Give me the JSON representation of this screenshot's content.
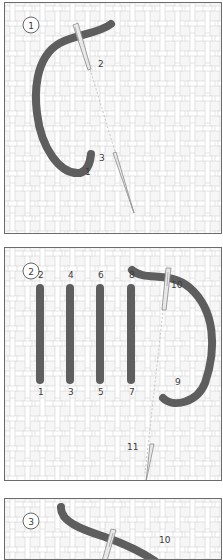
{
  "diagram": {
    "panels": [
      {
        "step": "1",
        "labels": [
          {
            "text": "2",
            "x": 93,
            "y": 64
          },
          {
            "text": "3",
            "x": 94,
            "y": 158
          },
          {
            "text": "1",
            "x": 80,
            "y": 172
          }
        ]
      },
      {
        "step": "2",
        "labels": [
          {
            "text": "2",
            "x": 33,
            "y": 30
          },
          {
            "text": "4",
            "x": 63,
            "y": 30
          },
          {
            "text": "6",
            "x": 93,
            "y": 30
          },
          {
            "text": "8",
            "x": 124,
            "y": 30
          },
          {
            "text": "10",
            "x": 166,
            "y": 40
          },
          {
            "text": "1",
            "x": 33,
            "y": 147
          },
          {
            "text": "3",
            "x": 63,
            "y": 147
          },
          {
            "text": "5",
            "x": 93,
            "y": 147
          },
          {
            "text": "7",
            "x": 124,
            "y": 147
          },
          {
            "text": "9",
            "x": 170,
            "y": 137
          },
          {
            "text": "11",
            "x": 122,
            "y": 202
          }
        ]
      },
      {
        "step": "3",
        "labels": [
          {
            "text": "10",
            "x": 154,
            "y": 44
          }
        ]
      }
    ],
    "colors": {
      "thread": "#5e5e5e",
      "fabric": "#f4f4f4",
      "weave_line": "#cfcfcf",
      "border": "#6b6b6b",
      "needle": "#9a9a9a"
    }
  }
}
